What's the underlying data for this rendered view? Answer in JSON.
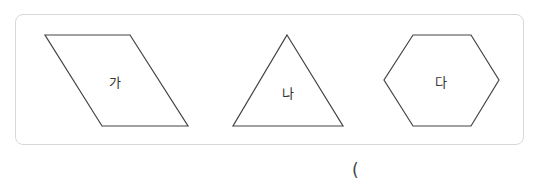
{
  "shapes": [
    {
      "name": "parallelogram",
      "label": "가"
    },
    {
      "name": "triangle",
      "label": "나"
    },
    {
      "name": "hexagon",
      "label": "다"
    }
  ],
  "answer": {
    "open_paren": "("
  },
  "colors": {
    "stroke": "#444444",
    "border": "#d8d8d8"
  }
}
